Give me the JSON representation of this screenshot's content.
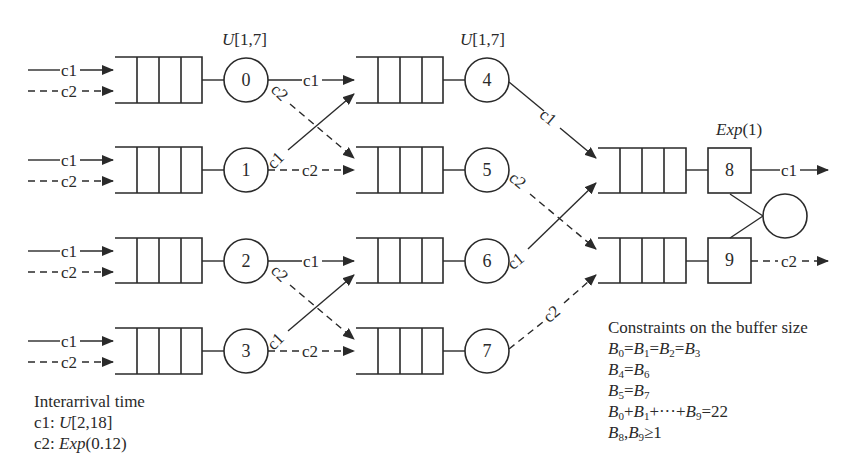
{
  "diagram": {
    "type": "queueing-network",
    "stage1": {
      "service_label": "U[1,7]",
      "servers": [
        {
          "id": "0",
          "inputs": [
            "c1",
            "c2"
          ],
          "outputs": [
            {
              "class": "c1",
              "to": "4"
            },
            {
              "class": "c2",
              "to": "5"
            }
          ]
        },
        {
          "id": "1",
          "inputs": [
            "c1",
            "c2"
          ],
          "outputs": [
            {
              "class": "c1",
              "to": "4"
            },
            {
              "class": "c2",
              "to": "5"
            }
          ]
        },
        {
          "id": "2",
          "inputs": [
            "c1",
            "c2"
          ],
          "outputs": [
            {
              "class": "c1",
              "to": "6"
            },
            {
              "class": "c2",
              "to": "7"
            }
          ]
        },
        {
          "id": "3",
          "inputs": [
            "c1",
            "c2"
          ],
          "outputs": [
            {
              "class": "c1",
              "to": "6"
            },
            {
              "class": "c2",
              "to": "7"
            }
          ]
        }
      ]
    },
    "stage2": {
      "service_label": "U[1,7]",
      "servers": [
        {
          "id": "4",
          "output": {
            "class": "c1",
            "to": "8"
          }
        },
        {
          "id": "5",
          "output": {
            "class": "c2",
            "to": "9"
          }
        },
        {
          "id": "6",
          "output": {
            "class": "c1",
            "to": "8"
          }
        },
        {
          "id": "7",
          "output": {
            "class": "c2",
            "to": "9"
          }
        }
      ]
    },
    "stage3": {
      "service_label": "Exp(1)",
      "servers": [
        {
          "id": "8",
          "output": "c1"
        },
        {
          "id": "9",
          "output": "c2"
        }
      ]
    },
    "class_labels": {
      "c1": "c1",
      "c2": "c2"
    },
    "interarrival": {
      "title": "Interarrival time",
      "c1_prefix": "c1: ",
      "c1_dist": "U",
      "c1_params": "[2,18]",
      "c2_prefix": "c2: ",
      "c2_dist": "Exp",
      "c2_params": "(0.12)"
    },
    "constraints": {
      "title": "Constraints on the buffer size",
      "lines": [
        "B0=B1=B2=B3",
        "B4=B6",
        "B5=B7",
        "B0+B1+···+B9=22",
        "B8,B9≥1"
      ]
    },
    "labels": {
      "u17_a_dist": "U",
      "u17_a_params": "[1,7]",
      "u17_b_dist": "U",
      "u17_b_params": "[1,7]",
      "exp1_dist": "Exp",
      "exp1_params": "(1)",
      "server_0": "0",
      "server_1": "1",
      "server_2": "2",
      "server_3": "3",
      "server_4": "4",
      "server_5": "5",
      "server_6": "6",
      "server_7": "7",
      "server_8": "8",
      "server_9": "9"
    }
  }
}
